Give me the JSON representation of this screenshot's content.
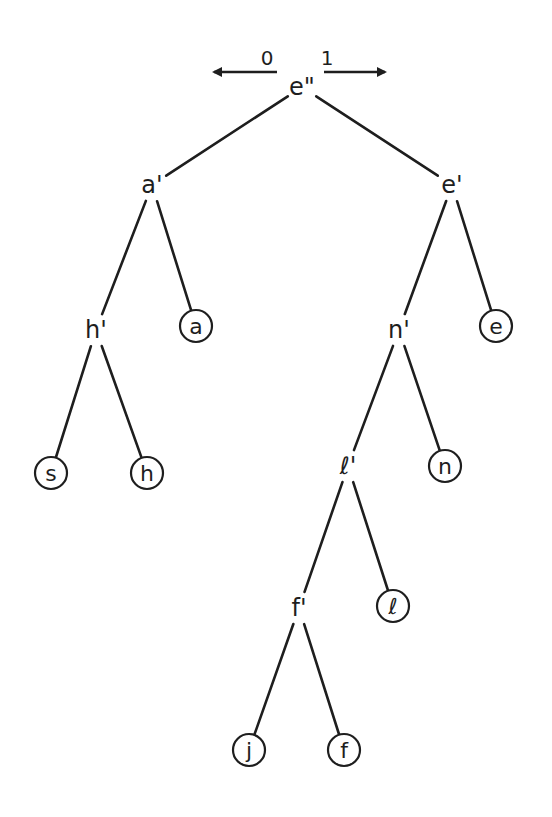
{
  "diagram": {
    "type": "huffman-tree",
    "direction_labels": {
      "left": "0",
      "right": "1"
    },
    "nodes": [
      {
        "id": "root",
        "label": "e\"",
        "kind": "internal",
        "x": 302,
        "y": 87
      },
      {
        "id": "a1",
        "label": "a'",
        "kind": "internal",
        "x": 152,
        "y": 185
      },
      {
        "id": "e1",
        "label": "e'",
        "kind": "internal",
        "x": 452,
        "y": 185
      },
      {
        "id": "h1",
        "label": "h'",
        "kind": "internal",
        "x": 96,
        "y": 330
      },
      {
        "id": "a",
        "label": "a",
        "kind": "leaf",
        "x": 196,
        "y": 326
      },
      {
        "id": "n1",
        "label": "n'",
        "kind": "internal",
        "x": 399,
        "y": 330
      },
      {
        "id": "e",
        "label": "e",
        "kind": "leaf",
        "x": 496,
        "y": 326
      },
      {
        "id": "s",
        "label": "s",
        "kind": "leaf",
        "x": 51,
        "y": 473
      },
      {
        "id": "h",
        "label": "h",
        "kind": "leaf",
        "x": 147,
        "y": 473
      },
      {
        "id": "l1",
        "label": "ℓ'",
        "kind": "internal",
        "x": 348,
        "y": 466
      },
      {
        "id": "n",
        "label": "n",
        "kind": "leaf",
        "x": 445,
        "y": 466
      },
      {
        "id": "f1",
        "label": "f'",
        "kind": "internal",
        "x": 299,
        "y": 608
      },
      {
        "id": "l",
        "label": "ℓ",
        "kind": "leaf",
        "x": 393,
        "y": 606
      },
      {
        "id": "j",
        "label": "j",
        "kind": "leaf",
        "x": 249,
        "y": 750
      },
      {
        "id": "f",
        "label": "f",
        "kind": "leaf",
        "x": 344,
        "y": 750
      }
    ],
    "edges": [
      [
        "root",
        "a1"
      ],
      [
        "root",
        "e1"
      ],
      [
        "a1",
        "h1"
      ],
      [
        "a1",
        "a"
      ],
      [
        "e1",
        "n1"
      ],
      [
        "e1",
        "e"
      ],
      [
        "h1",
        "s"
      ],
      [
        "h1",
        "h"
      ],
      [
        "n1",
        "l1"
      ],
      [
        "n1",
        "n"
      ],
      [
        "l1",
        "f1"
      ],
      [
        "l1",
        "l"
      ],
      [
        "f1",
        "j"
      ],
      [
        "f1",
        "f"
      ]
    ]
  }
}
